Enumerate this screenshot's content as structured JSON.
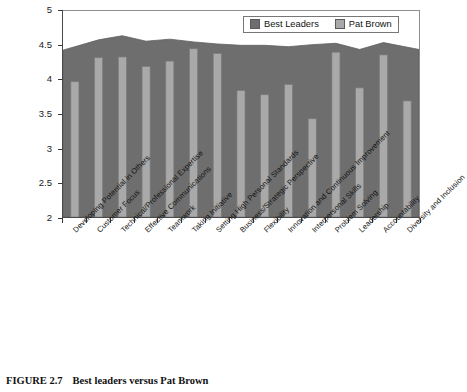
{
  "figure": {
    "caption_label": "FIGURE 2.7",
    "caption_text": "Best leaders versus Pat Brown"
  },
  "legend": {
    "position": "top-right",
    "items": [
      {
        "label": "Best Leaders",
        "color": "#6e6e6e",
        "icon": "legend-swatch"
      },
      {
        "label": "Pat Brown",
        "color": "#a9a9a9",
        "icon": "legend-swatch"
      }
    ]
  },
  "axes": {
    "y_ticks": [
      "2",
      "2.5",
      "3",
      "3.5",
      "4",
      "4.5",
      "5"
    ]
  },
  "chart_data": {
    "type": "bar",
    "title": "Best leaders versus Pat Brown",
    "xlabel": "",
    "ylabel": "",
    "ylim": [
      2,
      5
    ],
    "ytick_step": 0.5,
    "grid": false,
    "legend_position": "top-right",
    "categories": [
      "Developing Potential in Others",
      "Customer Focus",
      "Technical/Professional Expertise",
      "Effective Communications",
      "Teamwork",
      "Taking Initiative",
      "Setting High Personal Standards",
      "Business/Strategic Perspective",
      "Flexibility",
      "Innovation and Continuous Improvement",
      "Interpersonal Skills",
      "Problem Solving",
      "Leadership",
      "Accountability",
      "Diversity and Inclusion"
    ],
    "series": [
      {
        "name": "Best Leaders",
        "render": "area",
        "color": "#6e6e6e",
        "values": [
          4.43,
          4.58,
          4.64,
          4.56,
          4.59,
          4.55,
          4.52,
          4.5,
          4.5,
          4.48,
          4.51,
          4.53,
          4.44,
          4.54,
          4.44
        ]
      },
      {
        "name": "Pat Brown",
        "render": "column",
        "color": "#a9a9a9",
        "values": [
          3.97,
          4.32,
          4.33,
          4.19,
          4.27,
          4.45,
          4.38,
          3.84,
          3.78,
          3.93,
          3.43,
          4.4,
          3.88,
          4.36,
          3.69
        ]
      }
    ]
  }
}
